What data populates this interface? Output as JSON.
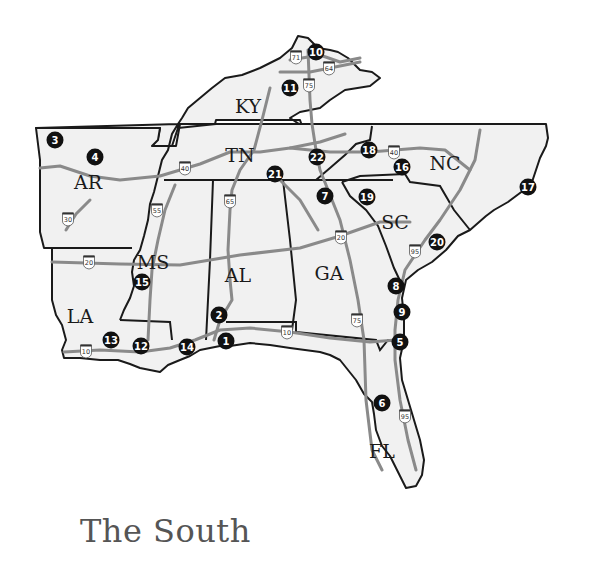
{
  "map": {
    "title": "The South",
    "colors": {
      "land": "#f1f1f1",
      "border": "#1a1a1a",
      "highway": "#8a8a8a",
      "marker": "#111111",
      "title": "#555555"
    },
    "states": [
      {
        "abbr": "KY",
        "x": 248,
        "y": 106
      },
      {
        "abbr": "TN",
        "x": 240,
        "y": 155
      },
      {
        "abbr": "AR",
        "x": 88,
        "y": 182
      },
      {
        "abbr": "NC",
        "x": 445,
        "y": 163
      },
      {
        "abbr": "SC",
        "x": 395,
        "y": 222
      },
      {
        "abbr": "MS",
        "x": 153,
        "y": 262
      },
      {
        "abbr": "AL",
        "x": 238,
        "y": 275
      },
      {
        "abbr": "GA",
        "x": 329,
        "y": 273
      },
      {
        "abbr": "LA",
        "x": 80,
        "y": 316
      },
      {
        "abbr": "FL",
        "x": 382,
        "y": 451
      }
    ],
    "markers": [
      {
        "n": "1",
        "x": 226,
        "y": 341
      },
      {
        "n": "2",
        "x": 219,
        "y": 315
      },
      {
        "n": "3",
        "x": 55,
        "y": 140
      },
      {
        "n": "4",
        "x": 95,
        "y": 157
      },
      {
        "n": "5",
        "x": 400,
        "y": 342
      },
      {
        "n": "6",
        "x": 382,
        "y": 403
      },
      {
        "n": "7",
        "x": 325,
        "y": 196
      },
      {
        "n": "8",
        "x": 396,
        "y": 286
      },
      {
        "n": "9",
        "x": 402,
        "y": 312
      },
      {
        "n": "10",
        "x": 316,
        "y": 52
      },
      {
        "n": "11",
        "x": 290,
        "y": 88
      },
      {
        "n": "12",
        "x": 141,
        "y": 346
      },
      {
        "n": "13",
        "x": 111,
        "y": 340
      },
      {
        "n": "14",
        "x": 187,
        "y": 347
      },
      {
        "n": "15",
        "x": 142,
        "y": 282
      },
      {
        "n": "16",
        "x": 402,
        "y": 167
      },
      {
        "n": "17",
        "x": 528,
        "y": 187
      },
      {
        "n": "18",
        "x": 369,
        "y": 150
      },
      {
        "n": "19",
        "x": 367,
        "y": 197
      },
      {
        "n": "20",
        "x": 437,
        "y": 242
      },
      {
        "n": "21",
        "x": 275,
        "y": 174
      },
      {
        "n": "22",
        "x": 317,
        "y": 157
      }
    ],
    "highway_shields": [
      {
        "num": "71",
        "x": 296,
        "y": 57
      },
      {
        "num": "64",
        "x": 329,
        "y": 68
      },
      {
        "num": "75",
        "x": 309,
        "y": 85
      },
      {
        "num": "40",
        "x": 185,
        "y": 168
      },
      {
        "num": "40",
        "x": 394,
        "y": 152
      },
      {
        "num": "30",
        "x": 68,
        "y": 219
      },
      {
        "num": "55",
        "x": 157,
        "y": 210
      },
      {
        "num": "65",
        "x": 230,
        "y": 201
      },
      {
        "num": "20",
        "x": 89,
        "y": 262
      },
      {
        "num": "20",
        "x": 341,
        "y": 237
      },
      {
        "num": "95",
        "x": 415,
        "y": 251
      },
      {
        "num": "10",
        "x": 86,
        "y": 351
      },
      {
        "num": "10",
        "x": 287,
        "y": 332
      },
      {
        "num": "75",
        "x": 357,
        "y": 320
      },
      {
        "num": "95",
        "x": 405,
        "y": 416
      }
    ]
  }
}
